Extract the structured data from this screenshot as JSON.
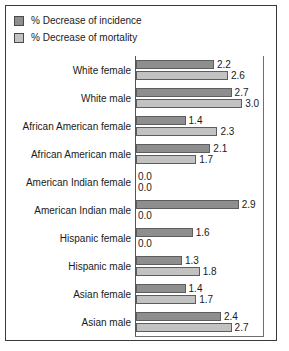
{
  "legend": {
    "items": [
      {
        "label": "% Decrease of incidence",
        "color": "#8e8e8e",
        "key": "incidence"
      },
      {
        "label": "% Decrease of mortality",
        "color": "#c2c2c2",
        "key": "mortality"
      }
    ]
  },
  "chart_data": {
    "type": "bar",
    "orientation": "horizontal",
    "title": "",
    "xlabel": "",
    "ylabel": "",
    "grid": false,
    "legend_position": "top-left",
    "xlim": [
      0,
      3.0
    ],
    "categories": [
      "White female",
      "White male",
      "African American female",
      "African American male",
      "American Indian female",
      "American Indian male",
      "Hispanic female",
      "Hispanic male",
      "Asian female",
      "Asian male"
    ],
    "series": [
      {
        "name": "% Decrease of incidence",
        "color": "#8e8e8e",
        "values": [
          2.2,
          2.7,
          1.4,
          2.1,
          0.0,
          2.9,
          1.6,
          1.3,
          1.4,
          2.4
        ]
      },
      {
        "name": "% Decrease of mortality",
        "color": "#c2c2c2",
        "values": [
          2.6,
          3.0,
          2.3,
          1.7,
          0.0,
          0.0,
          0.0,
          1.8,
          1.7,
          2.7
        ]
      }
    ],
    "value_labels": [
      [
        "2.2",
        "2.6"
      ],
      [
        "2.7",
        "3.0"
      ],
      [
        "1.4",
        "2.3"
      ],
      [
        "2.1",
        "1.7"
      ],
      [
        "0.0",
        "0.0"
      ],
      [
        "2.9",
        "0.0"
      ],
      [
        "1.6",
        "0.0"
      ],
      [
        "1.3",
        "1.8"
      ],
      [
        "1.4",
        "1.7"
      ],
      [
        "2.4",
        "2.7"
      ]
    ]
  }
}
